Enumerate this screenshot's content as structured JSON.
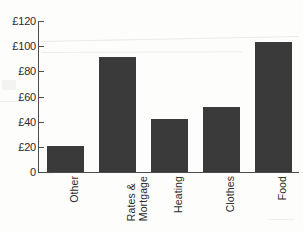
{
  "chart_data": {
    "type": "bar",
    "title": "",
    "xlabel": "",
    "ylabel": "",
    "categories": [
      "Other",
      "Rates &\nMortgage",
      "Heating",
      "Clothes",
      "Food"
    ],
    "values": [
      21,
      91,
      42,
      52,
      103
    ],
    "ylim": [
      0,
      120
    ],
    "y_ticks": [
      0,
      20,
      40,
      60,
      80,
      100,
      120
    ],
    "y_tick_labels": [
      "0",
      "£20",
      "£40",
      "£60",
      "£80",
      "£100",
      "£120"
    ],
    "grid": false,
    "legend": null,
    "bar_color": "#3a3a3a",
    "axis_color": "#4d4d4d",
    "background_color": "#fdfdfc"
  },
  "axes": {
    "y_tick_labels": [
      {
        "text": "£120",
        "value": 120
      },
      {
        "text": "£100",
        "value": 100
      },
      {
        "text": "£80",
        "value": 80
      },
      {
        "text": "£60",
        "value": 60
      },
      {
        "text": "£40",
        "value": 40
      },
      {
        "text": "£20",
        "value": 20
      },
      {
        "text": "0",
        "value": 0
      }
    ],
    "x_tick_labels": [
      {
        "line1": "Other",
        "line2": ""
      },
      {
        "line1": "Rates &",
        "line2": "Mortgage"
      },
      {
        "line1": "Heating",
        "line2": ""
      },
      {
        "line1": "Clothes",
        "line2": ""
      },
      {
        "line1": "Food",
        "line2": ""
      }
    ]
  },
  "title": {
    "text": ""
  }
}
